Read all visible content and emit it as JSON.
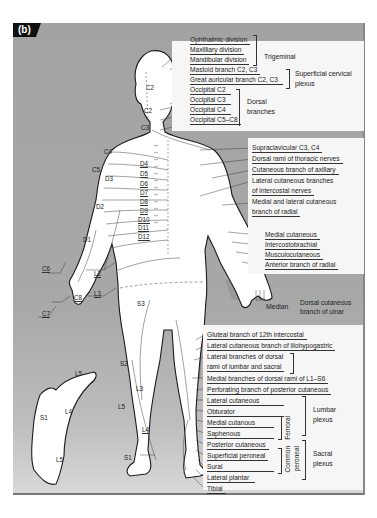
{
  "figure": {
    "panel_label": "(b)",
    "colors": {
      "background_grey": "#a6a6a6",
      "label_box": "#f6f6f6",
      "body_fill": "#ffffff",
      "shaded_region": "#8e8e8e",
      "outline": "#1a1a1a",
      "panel_label_bg": "#111111"
    }
  },
  "head_labels": {
    "trigeminal": {
      "group": "Trigeminal",
      "items": [
        "Ophthalmic division",
        "Maxilliary division",
        "Mandibular division"
      ]
    },
    "superficial_cervical": {
      "group": "Superficial cervical plexus",
      "group_line1": "Superficial cervical",
      "group_line2": "plexus",
      "items": [
        "Mastoid branch C2, C3",
        "Great auricular branch C2, C3"
      ]
    },
    "dorsal_branches": {
      "group": "Dorsal branches",
      "group_line1": "Dorsal",
      "group_line2": "branches",
      "items": [
        "Occipital C2",
        "Occipital C3",
        "Occipital C4",
        "Occipital C5–C8"
      ]
    }
  },
  "trunk_labels": {
    "items": [
      "Supraclavicular C3, C4",
      "Dorsal rami of thoracic nerves",
      "Cutaneous branch of axillary",
      "Lateral cutaneous branches",
      "of intercostal nerves",
      "Medial and lateral cutaneous",
      "branch of radial"
    ]
  },
  "arm_labels": {
    "items": [
      "Medial cutaneous",
      "Intercostobrachial",
      "Musculocutaneous",
      "Anterior branch of radial"
    ]
  },
  "hand_labels": {
    "median": "Median",
    "ulnar_line1": "Dorsal cutaneous",
    "ulnar_line2": "branch of ulnar"
  },
  "lower_labels": {
    "items": [
      "Gluteal branch of 12th intercostal",
      "Lateral cutaneous branch of iliohypogastric",
      "Lateral branches of dorsal",
      "rami of lumbar and sacral",
      "Medial branches of dorsal rami of L1–S6",
      "Perforating branch of posterior cutaneous"
    ]
  },
  "leg_labels": {
    "items": [
      "Lateral cutaneous",
      "Obturator",
      "Medial cutanous",
      "Saphenous",
      "Posterior cutaneous",
      "Superficial peroneal",
      "Sural",
      "Lateral plantar",
      "Tibial"
    ],
    "femoral": "Femoral",
    "common_peroneal_1": "Common",
    "common_peroneal_2": "peroneal",
    "lumbar_plexus_1": "Lumbar",
    "lumbar_plexus_2": "plexus",
    "sacral_plexus_1": "Sacral",
    "sacral_plexus_2": "plexus"
  },
  "dermatomes": {
    "head": [
      "C2",
      "C2",
      "C3"
    ],
    "shoulder": [
      "C4",
      "C5",
      "D3",
      "D2",
      "D1"
    ],
    "thoracic": [
      "D4",
      "D5",
      "D6",
      "D7",
      "D8",
      "D9",
      "D10",
      "D11",
      "D12"
    ],
    "arm": [
      "C6",
      "C8",
      "C7"
    ],
    "lumbar": [
      "L2",
      "L3"
    ],
    "sacral": [
      "S3",
      "S2",
      "L3",
      "L5",
      "L4",
      "S1"
    ],
    "foot": [
      "L5",
      "L4",
      "S1",
      "L5"
    ]
  }
}
